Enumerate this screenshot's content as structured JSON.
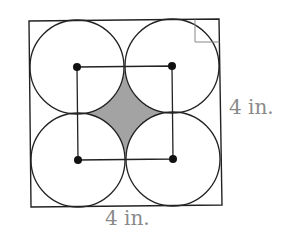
{
  "figure": {
    "outer_square": {
      "corners": [
        [
          29,
          21
        ],
        [
          219,
          19
        ],
        [
          222,
          205
        ],
        [
          31,
          207
        ]
      ],
      "stroke": "#222222"
    },
    "right_angle_marker": {
      "points": [
        [
          195,
          19.5
        ],
        [
          195,
          42
        ],
        [
          219.5,
          42
        ]
      ],
      "stroke": "#888888"
    },
    "circles": [
      {
        "cx": 77,
        "cy": 67,
        "r": 47
      },
      {
        "cx": 172,
        "cy": 66,
        "r": 47
      },
      {
        "cx": 78,
        "cy": 160,
        "r": 47
      },
      {
        "cx": 173,
        "cy": 159,
        "r": 47
      }
    ],
    "circle_stroke": "#222222",
    "center_dots": {
      "r": 4,
      "fill": "#111111"
    },
    "inner_square_stroke": "#222222",
    "shaded_region": {
      "fill": "#a3a3a3",
      "stroke": "#222222"
    }
  },
  "labels": {
    "right_side": "4 in.",
    "bottom_side": "4 in."
  }
}
